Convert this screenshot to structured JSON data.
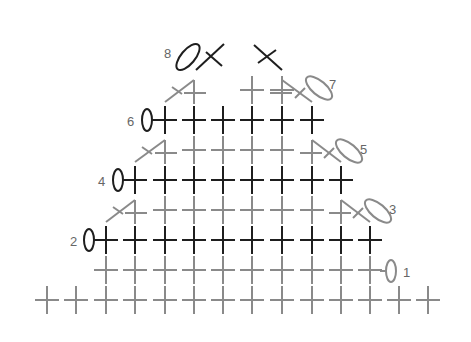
{
  "diagram": {
    "type": "crochet-stitch-chart",
    "colors": {
      "dark": "#1e1e1e",
      "light": "#8a8a8a",
      "label": "#666666",
      "background": "#ffffff"
    },
    "col_x": [
      47,
      76,
      106,
      135,
      165,
      194,
      223,
      252,
      282,
      312,
      341,
      370,
      399,
      428
    ],
    "rows": [
      {
        "id": 0,
        "label": "",
        "y": 300,
        "tone": "light",
        "sc_cols": [
          0,
          1,
          2,
          3,
          4,
          5,
          6,
          7,
          8,
          9,
          10,
          11,
          12,
          13
        ]
      },
      {
        "id": 1,
        "label": "1",
        "y": 270,
        "tone": "light",
        "sc_cols": [
          2,
          3,
          4,
          5,
          6,
          7,
          8,
          9,
          10,
          11
        ],
        "chain": {
          "side": "right",
          "cx": 391,
          "cy": 271,
          "rx": 5,
          "ry": 11,
          "rot": 0
        },
        "label_x": 403,
        "label_y": 277
      },
      {
        "id": 2,
        "label": "2",
        "y": 240,
        "tone": "dark",
        "sc_cols": [
          2,
          3,
          4,
          5,
          6,
          7,
          8,
          9,
          10,
          11
        ],
        "chain": {
          "side": "left",
          "cx": 89,
          "cy": 240,
          "rx": 5,
          "ry": 11,
          "rot": 0
        },
        "label_x": 70,
        "label_y": 246
      },
      {
        "id": 3,
        "label": "3",
        "y": 210,
        "tone": "light",
        "sc_cols": [
          4,
          5,
          6,
          7,
          8,
          9
        ],
        "dec_left": {
          "x1": 106,
          "x2": 135
        },
        "dec_right": {
          "x1": 341,
          "x2": 370
        },
        "chain": {
          "side": "right",
          "cx": 378,
          "cy": 211,
          "rx": 16,
          "ry": 7,
          "rot": 40
        },
        "label_x": 389,
        "label_y": 214
      },
      {
        "id": 4,
        "label": "4",
        "y": 180,
        "tone": "dark",
        "sc_cols": [
          3,
          4,
          5,
          6,
          7,
          8,
          9,
          10
        ],
        "chain": {
          "side": "left",
          "cx": 118,
          "cy": 180,
          "rx": 5,
          "ry": 11,
          "rot": 0
        },
        "label_x": 98,
        "label_y": 186
      },
      {
        "id": 5,
        "label": "5",
        "y": 150,
        "tone": "light",
        "sc_cols": [
          5,
          6,
          7,
          8
        ],
        "dec_left": {
          "x1": 135,
          "x2": 165
        },
        "dec_right": {
          "x1": 312,
          "x2": 341
        },
        "chain": {
          "side": "right",
          "cx": 349,
          "cy": 151,
          "rx": 16,
          "ry": 7,
          "rot": 40
        },
        "label_x": 360,
        "label_y": 154
      },
      {
        "id": 6,
        "label": "6",
        "y": 120,
        "tone": "dark",
        "sc_cols": [
          4,
          5,
          6,
          7,
          8,
          9
        ],
        "chain": {
          "side": "left",
          "cx": 147,
          "cy": 120,
          "rx": 5,
          "ry": 11,
          "rot": 0
        },
        "label_x": 127,
        "label_y": 126
      },
      {
        "id": 7,
        "label": "7",
        "y": 90,
        "tone": "light",
        "sc_cols": [
          7,
          8
        ],
        "dec_left": {
          "x1": 165,
          "x2": 194
        },
        "dec_right": {
          "x1": 282,
          "x2": 312
        },
        "chain": {
          "side": "right",
          "cx": 319,
          "cy": 88,
          "rx": 16,
          "ry": 7,
          "rot": 40
        },
        "label_x": 329,
        "label_y": 89
      },
      {
        "id": 8,
        "label": "8",
        "y": 55,
        "tone": "dark",
        "x_stitches": [
          {
            "a": [
              196,
              70,
              224,
              44
            ],
            "b": [
              206,
              52,
              222,
              66
            ]
          },
          {
            "a": [
              254,
              45,
              282,
              70
            ],
            "b": [
              258,
              63,
              276,
              50
            ]
          }
        ],
        "chain": {
          "side": "left",
          "cx": 188,
          "cy": 57,
          "rx": 16,
          "ry": 7,
          "rot": -50
        },
        "label_x": 164,
        "label_y": 58
      }
    ]
  }
}
